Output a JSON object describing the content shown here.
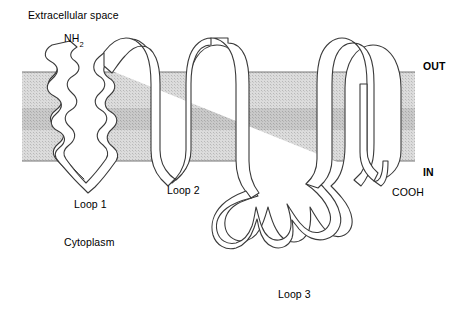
{
  "figure": {
    "width": 464,
    "height": 312,
    "background_color": "#ffffff"
  },
  "membrane": {
    "outer_band_color": "#d6d6d6",
    "inner_band_color": "#c2c2c2",
    "edge_line_color": "#808080",
    "left": 22,
    "right": 415,
    "top": 72,
    "bottom": 161,
    "inner_top": 108,
    "inner_bottom": 130
  },
  "chain": {
    "stroke_color": "#333333",
    "fill_color": "#ffffff",
    "ribbon_width": 7
  },
  "labels": {
    "extracellular": "Extracellular space",
    "n_terminus": "NH",
    "n_terminus_subscript": "2",
    "out": "OUT",
    "in": "IN",
    "loop1": "Loop 1",
    "loop2": "Loop 2",
    "loop3": "Loop 3",
    "c_terminus": "COOH",
    "cytoplasm": "Cytoplasm"
  }
}
